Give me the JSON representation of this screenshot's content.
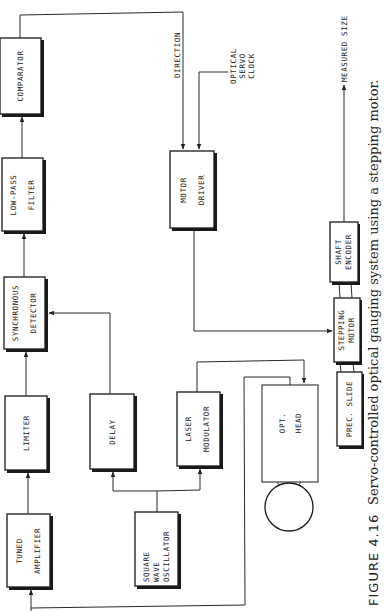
{
  "figure": {
    "number_label": "FIGURE 4.16",
    "caption": "Servo-controlled optical gauging system using a stepping motor."
  },
  "blocks": {
    "comparator": {
      "line1": "COMPARATOR"
    },
    "low_pass_filter": {
      "line1": "LOW-PASS",
      "line2": "FILTER"
    },
    "synchronous_detector": {
      "line1": "SYNCHRONOUS",
      "line2": "DETECTOR"
    },
    "limiter": {
      "line1": "LIMITER"
    },
    "tuned_amplifier": {
      "line1": "TUNED",
      "line2": "AMPLIFIER"
    },
    "delay": {
      "line1": "DELAY"
    },
    "laser_modulator": {
      "line1": "LASER",
      "line2": "MODULATOR"
    },
    "square_wave_oscillator": {
      "line1": "SQUARE",
      "line2": "WAVE",
      "line3": "OSCILLATOR"
    },
    "motor_driver": {
      "line1": "MOTOR",
      "line2": "DRIVER"
    },
    "opt_head": {
      "line1": "OPT.",
      "line2": "HEAD"
    },
    "prec_slide": {
      "line1": "PREC. SLIDE"
    },
    "stepping_motor": {
      "line1": "STEPPING",
      "line2": "MOTOR"
    },
    "shaft_encoder": {
      "line1": "SHAFT",
      "line2": "ENCODER"
    }
  },
  "signals": {
    "direction": "DIRECTION",
    "optical_servo_clock": {
      "line1": "OPTICAL",
      "line2": "SERVO",
      "line3": "CLOCK"
    },
    "measured_size": "MEASURED SIZE"
  }
}
